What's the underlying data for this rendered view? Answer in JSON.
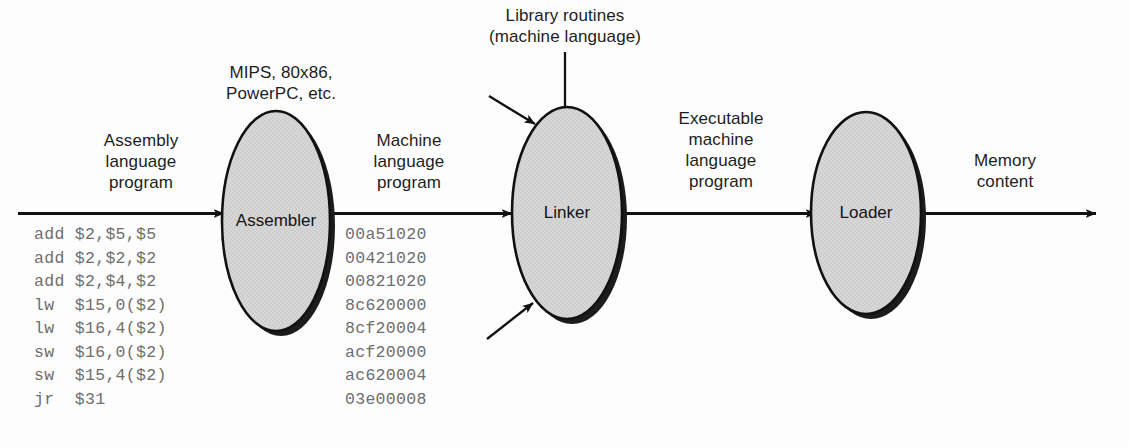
{
  "figure": {
    "background_color": "#fdfdfd",
    "ellipse_fill": "#d6d6d6",
    "ellipse_stroke": "#111111",
    "shadow_color": "#1a1a1a",
    "arrow_color": "#111111",
    "label_color": "#1d1d1d",
    "code_color": "#6e6e6e"
  },
  "labels": {
    "assembly_input": "Assembly\nlanguage\nprogram",
    "isa_note": "MIPS, 80x86,\nPowerPC, etc.",
    "machine_language": "Machine\nlanguage\nprogram",
    "library_routines": "Library routines\n(machine language)",
    "executable": "Executable\nmachine\nlanguage\nprogram",
    "memory_content": "Memory\ncontent"
  },
  "nodes": [
    {
      "id": "assembler",
      "label": "Assembler"
    },
    {
      "id": "linker",
      "label": "Linker"
    },
    {
      "id": "loader",
      "label": "Loader"
    }
  ],
  "assembly_listing": [
    "add $2,$5,$5",
    "add $2,$2,$2",
    "add $2,$4,$2",
    "lw  $15,0($2)",
    "lw  $16,4($2)",
    "sw  $16,0($2)",
    "sw  $15,4($2)",
    "jr  $31"
  ],
  "machine_listing": [
    "00a51020",
    "00421020",
    "00821020",
    "8c620000",
    "8cf20004",
    "acf20000",
    "ac620004",
    "03e00008"
  ]
}
